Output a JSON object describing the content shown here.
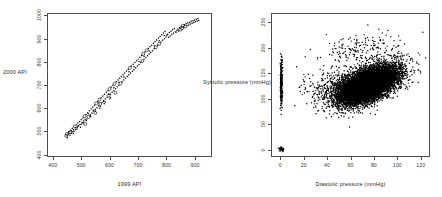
{
  "figure": {
    "background": "#ffffff",
    "frame_color": "#4d4d4d",
    "point_color": "#000000",
    "panels": 2
  },
  "chart_data": [
    {
      "type": "scatter",
      "panel": "left",
      "title": "",
      "xlabel": "1999 API",
      "ylabel": "2000 API",
      "xlim": [
        380,
        960
      ],
      "ylim": [
        390,
        1010
      ],
      "xticks": [
        400,
        500,
        600,
        700,
        800,
        900
      ],
      "yticks": [
        400,
        500,
        600,
        700,
        800,
        900,
        1000
      ],
      "grid": false,
      "legend": "none",
      "n_points": 200,
      "description": "Strong positive linear relationship between 1999 API and 2000 API school scores; mix of small filled dots and small open circles.",
      "points": [
        [
          444,
          478
        ],
        [
          447,
          486
        ],
        [
          449,
          470
        ],
        [
          452,
          492
        ],
        [
          455,
          497
        ],
        [
          458,
          481
        ],
        [
          461,
          503
        ],
        [
          463,
          489
        ],
        [
          466,
          511
        ],
        [
          470,
          505
        ],
        [
          472,
          498
        ],
        [
          475,
          519
        ],
        [
          478,
          513
        ],
        [
          481,
          527
        ],
        [
          483,
          508
        ],
        [
          486,
          534
        ],
        [
          489,
          522
        ],
        [
          492,
          541
        ],
        [
          495,
          516
        ],
        [
          498,
          548
        ],
        [
          501,
          536
        ],
        [
          504,
          556
        ],
        [
          507,
          543
        ],
        [
          510,
          563
        ],
        [
          512,
          530
        ],
        [
          515,
          571
        ],
        [
          518,
          552
        ],
        [
          521,
          579
        ],
        [
          524,
          561
        ],
        [
          527,
          588
        ],
        [
          530,
          570
        ],
        [
          533,
          596
        ],
        [
          536,
          578
        ],
        [
          539,
          604
        ],
        [
          542,
          586
        ],
        [
          545,
          612
        ],
        [
          548,
          594
        ],
        [
          551,
          620
        ],
        [
          554,
          601
        ],
        [
          557,
          628
        ],
        [
          560,
          609
        ],
        [
          563,
          636
        ],
        [
          566,
          617
        ],
        [
          569,
          644
        ],
        [
          572,
          624
        ],
        [
          575,
          652
        ],
        [
          578,
          631
        ],
        [
          581,
          660
        ],
        [
          584,
          639
        ],
        [
          587,
          668
        ],
        [
          590,
          646
        ],
        [
          593,
          675
        ],
        [
          596,
          654
        ],
        [
          599,
          683
        ],
        [
          602,
          661
        ],
        [
          605,
          691
        ],
        [
          608,
          669
        ],
        [
          611,
          699
        ],
        [
          614,
          676
        ],
        [
          617,
          706
        ],
        [
          620,
          684
        ],
        [
          623,
          714
        ],
        [
          626,
          692
        ],
        [
          629,
          722
        ],
        [
          632,
          699
        ],
        [
          635,
          729
        ],
        [
          638,
          707
        ],
        [
          641,
          737
        ],
        [
          644,
          714
        ],
        [
          647,
          745
        ],
        [
          650,
          722
        ],
        [
          653,
          752
        ],
        [
          656,
          730
        ],
        [
          659,
          760
        ],
        [
          662,
          737
        ],
        [
          665,
          768
        ],
        [
          668,
          745
        ],
        [
          671,
          775
        ],
        [
          674,
          752
        ],
        [
          677,
          783
        ],
        [
          680,
          760
        ],
        [
          683,
          791
        ],
        [
          686,
          767
        ],
        [
          689,
          798
        ],
        [
          692,
          775
        ],
        [
          695,
          806
        ],
        [
          698,
          783
        ],
        [
          701,
          813
        ],
        [
          704,
          790
        ],
        [
          707,
          821
        ],
        [
          710,
          798
        ],
        [
          713,
          829
        ],
        [
          716,
          805
        ],
        [
          719,
          836
        ],
        [
          722,
          813
        ],
        [
          725,
          844
        ],
        [
          728,
          820
        ],
        [
          731,
          851
        ],
        [
          734,
          828
        ],
        [
          737,
          859
        ],
        [
          740,
          835
        ],
        [
          743,
          867
        ],
        [
          746,
          843
        ],
        [
          749,
          874
        ],
        [
          752,
          850
        ],
        [
          755,
          882
        ],
        [
          758,
          858
        ],
        [
          761,
          889
        ],
        [
          764,
          865
        ],
        [
          767,
          897
        ],
        [
          770,
          873
        ],
        [
          773,
          904
        ],
        [
          776,
          880
        ],
        [
          779,
          912
        ],
        [
          782,
          888
        ],
        [
          785,
          919
        ],
        [
          788,
          895
        ],
        [
          791,
          927
        ],
        [
          794,
          902
        ],
        [
          797,
          934
        ],
        [
          800,
          910
        ],
        [
          803,
          916
        ],
        [
          806,
          922
        ],
        [
          809,
          908
        ],
        [
          812,
          929
        ],
        [
          815,
          914
        ],
        [
          818,
          935
        ],
        [
          821,
          920
        ],
        [
          824,
          941
        ],
        [
          827,
          926
        ],
        [
          830,
          947
        ],
        [
          833,
          932
        ],
        [
          836,
          930
        ],
        [
          839,
          938
        ],
        [
          842,
          944
        ],
        [
          845,
          936
        ],
        [
          848,
          950
        ],
        [
          851,
          942
        ],
        [
          854,
          955
        ],
        [
          857,
          947
        ],
        [
          860,
          959
        ],
        [
          863,
          951
        ],
        [
          866,
          963
        ],
        [
          869,
          955
        ],
        [
          872,
          967
        ],
        [
          875,
          959
        ],
        [
          878,
          971
        ],
        [
          881,
          962
        ],
        [
          884,
          974
        ],
        [
          887,
          966
        ],
        [
          890,
          978
        ],
        [
          893,
          970
        ],
        [
          896,
          981
        ],
        [
          899,
          973
        ],
        [
          902,
          984
        ],
        [
          905,
          976
        ],
        [
          908,
          987
        ],
        [
          911,
          979
        ],
        [
          914,
          990
        ],
        [
          917,
          982
        ],
        [
          458,
          494
        ],
        [
          470,
          488
        ],
        [
          486,
          520
        ],
        [
          505,
          535
        ],
        [
          523,
          575
        ],
        [
          541,
          590
        ],
        [
          560,
          622
        ],
        [
          578,
          628
        ],
        [
          596,
          660
        ],
        [
          614,
          688
        ],
        [
          632,
          712
        ],
        [
          650,
          735
        ],
        [
          668,
          758
        ],
        [
          686,
          780
        ],
        [
          704,
          803
        ],
        [
          722,
          826
        ],
        [
          740,
          848
        ],
        [
          758,
          871
        ],
        [
          776,
          893
        ],
        [
          794,
          916
        ],
        [
          462,
          500
        ],
        [
          478,
          505
        ],
        [
          494,
          528
        ],
        [
          512,
          548
        ],
        [
          530,
          566
        ],
        [
          548,
          586
        ],
        [
          566,
          606
        ],
        [
          584,
          626
        ],
        [
          602,
          646
        ],
        [
          620,
          666
        ],
        [
          452,
          484
        ],
        [
          468,
          496
        ],
        [
          484,
          515
        ],
        [
          500,
          530
        ],
        [
          516,
          545
        ],
        [
          532,
          562
        ],
        [
          548,
          578
        ],
        [
          564,
          598
        ],
        [
          580,
          618
        ],
        [
          600,
          640
        ]
      ]
    },
    {
      "type": "scatter",
      "panel": "right",
      "title": "",
      "xlabel": "Diastolic pressure (mmHg)",
      "ylabel": "Systolic pressure (mmHg)",
      "xlim": [
        -8,
        128
      ],
      "ylim": [
        -14,
        268
      ],
      "xticks": [
        0,
        20,
        40,
        60,
        80,
        100,
        120
      ],
      "yticks": [
        0,
        50,
        100,
        150,
        200,
        250
      ],
      "grid": false,
      "legend": "none",
      "n_points": 10000,
      "description": "Very dense overplotted cloud of blood-pressure readings; main mass centred near diastolic 70-80 / systolic 120-130, with a narrow vertical strip of points at diastolic = 0 (systolic 80-190) and a solid overplotted blob at the origin (0,0) representing missing values.",
      "clusters": [
        {
          "name": "main-cloud",
          "n": 9000,
          "cx": 75,
          "cy": 127,
          "sx": 13,
          "sy": 19,
          "corr": 0.55
        },
        {
          "name": "zero-diastolic-strip",
          "n": 260,
          "cx": 0,
          "cy": 130,
          "sx": 0.9,
          "sy": 22,
          "corr": 0.0
        },
        {
          "name": "origin-blob",
          "n": 40,
          "cx": 0,
          "cy": 0,
          "sx": 1.1,
          "sy": 2.4,
          "corr": 0.0
        },
        {
          "name": "low-diastolic-scatter",
          "n": 240,
          "cx": 40,
          "cy": 122,
          "sx": 11,
          "sy": 20,
          "corr": 0.25
        },
        {
          "name": "high-systolic-outliers",
          "n": 200,
          "cx": 72,
          "cy": 196,
          "sx": 18,
          "sy": 19,
          "corr": 0.2
        }
      ]
    }
  ]
}
